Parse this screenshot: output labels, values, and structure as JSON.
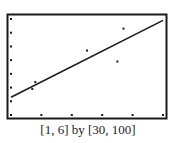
{
  "chart_data": {
    "type": "scatter",
    "title": "",
    "xlabel": "",
    "ylabel": "",
    "xlim": [
      1,
      6
    ],
    "ylim": [
      30,
      100
    ],
    "x_scale": 1,
    "y_scale": 10,
    "grid": false,
    "legend": null,
    "window_label": "[1, 6] by [30, 100]",
    "series": [
      {
        "name": "data points",
        "kind": "scatter",
        "points": [
          {
            "x": 1.7,
            "y": 49
          },
          {
            "x": 1.8,
            "y": 54
          },
          {
            "x": 3.5,
            "y": 77
          },
          {
            "x": 4.5,
            "y": 69
          },
          {
            "x": 4.7,
            "y": 93
          }
        ]
      },
      {
        "name": "regression line",
        "kind": "line",
        "points": [
          {
            "x": 1,
            "y": 43
          },
          {
            "x": 6,
            "y": 99
          }
        ]
      }
    ]
  },
  "caption": "[1, 6] by [30, 100]",
  "colors": {
    "ink": "#1a1a1a",
    "background": "#ffffff"
  }
}
